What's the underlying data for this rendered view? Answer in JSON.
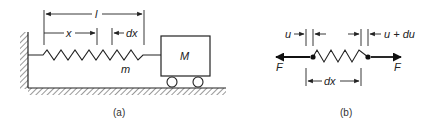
{
  "figure": {
    "panel_a": {
      "caption": "(a)",
      "labels": {
        "length": "l",
        "position": "x",
        "element": "dx",
        "spring_mass": "m",
        "block_mass": "M"
      }
    },
    "panel_b": {
      "caption": "(b)",
      "labels": {
        "left_displacement": "u",
        "right_displacement": "u + du",
        "element_length": "dx",
        "left_force": "F",
        "right_force": "F"
      }
    },
    "colors": {
      "ink": "#222222",
      "background": "#ffffff"
    }
  }
}
